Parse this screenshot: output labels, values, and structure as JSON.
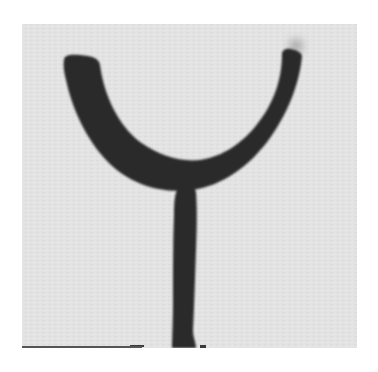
{
  "image": {
    "description": "Grayscale photograph of a dark Y-shaped object on a light gray background",
    "colors": {
      "object": "#2b2b2b",
      "background": "#e3e3e3",
      "page": "#ffffff"
    }
  }
}
